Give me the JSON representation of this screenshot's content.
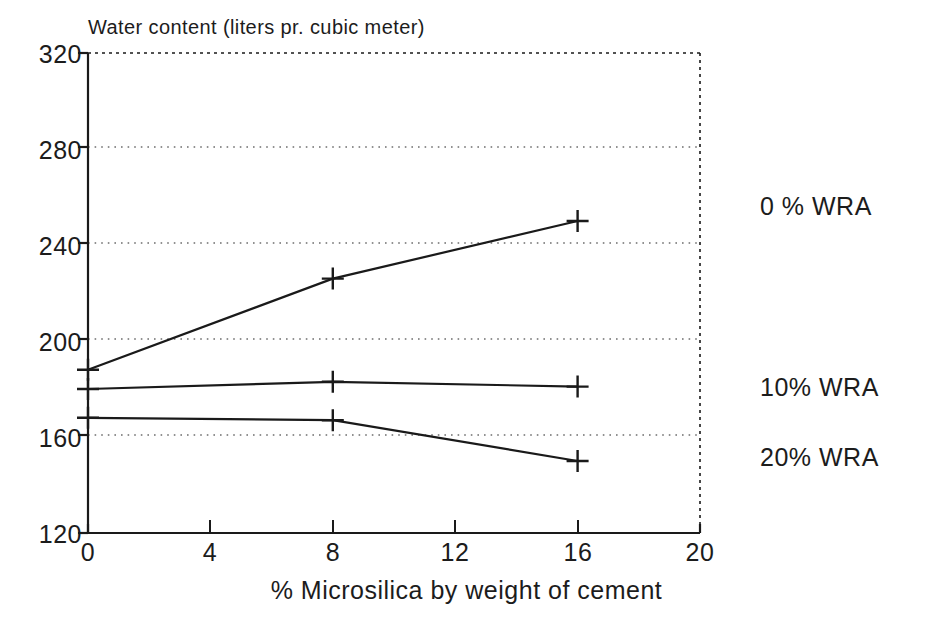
{
  "chart_data": {
    "type": "line",
    "title": "Water content (liters pr. cubic meter)",
    "xlabel": "% Microsilica by weight of cement",
    "ylabel": "Water content (liters pr. cubic meter)",
    "x": [
      0,
      8,
      16
    ],
    "xlim": [
      0,
      20
    ],
    "ylim": [
      120,
      320
    ],
    "xticks": [
      0,
      4,
      8,
      12,
      16,
      20
    ],
    "yticks": [
      120,
      160,
      200,
      240,
      280,
      320
    ],
    "xtick_labels": [
      "0",
      "4",
      "8",
      "12",
      "16",
      "20"
    ],
    "ytick_labels": [
      "120",
      "160",
      "200",
      "240",
      "280",
      "320"
    ],
    "grid": "horizontal-dotted",
    "legend_position": "right-inline-labels",
    "marker": "plus",
    "line_color": "#1a1a1a",
    "grid_color": "#808080",
    "axis_color": "#1a1a1a",
    "series": [
      {
        "name": "0 % WRA",
        "label": "0 % WRA",
        "values": [
          188,
          226,
          250
        ],
        "label_x": 16,
        "label_y": 250
      },
      {
        "name": "10% WRA",
        "label": "10% WRA",
        "values": [
          180,
          183,
          181
        ],
        "label_x": 16,
        "label_y": 181
      },
      {
        "name": "20% WRA",
        "label": "20% WRA",
        "values": [
          168,
          167,
          150
        ],
        "label_x": 16,
        "label_y": 150
      }
    ]
  }
}
